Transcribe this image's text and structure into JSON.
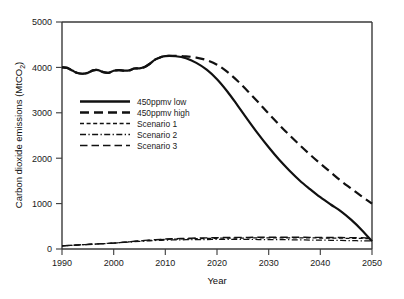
{
  "chart_data": {
    "type": "line",
    "title": "",
    "xlabel": "Year",
    "ylabel": "Carbon dioxide emissions (MtCO2)",
    "ylabel_display": "Carbon dioxide emissions (MtCO",
    "ylabel_sub": "2",
    "ylabel_tail": ")",
    "xlim": [
      1990,
      2050
    ],
    "ylim": [
      0,
      5000
    ],
    "xticks": [
      1990,
      2000,
      2010,
      2020,
      2030,
      2040,
      2050
    ],
    "xticklabels": [
      "1990",
      "2000",
      "2010",
      "2020",
      "2030",
      "2040",
      "2050"
    ],
    "yticks": [
      0,
      1000,
      2000,
      3000,
      4000,
      5000
    ],
    "yticklabels": [
      "0",
      "1000",
      "2000",
      "3000",
      "4000",
      "5000"
    ],
    "grid": false,
    "legend_position": "upper-left-inside",
    "line_color": "#111111",
    "x": [
      1990,
      1991,
      1992,
      1993,
      1994,
      1995,
      1996,
      1997,
      1998,
      1999,
      2000,
      2001,
      2002,
      2003,
      2004,
      2005,
      2006,
      2007,
      2008,
      2009,
      2010,
      2012,
      2014,
      2016,
      2018,
      2020,
      2022,
      2024,
      2026,
      2028,
      2030,
      2032,
      2034,
      2036,
      2038,
      2040,
      2042,
      2044,
      2046,
      2048,
      2050
    ],
    "series": [
      {
        "name": "450ppmv low",
        "style": "solid",
        "values": [
          4000,
          3990,
          3930,
          3875,
          3860,
          3880,
          3935,
          3940,
          3895,
          3880,
          3925,
          3940,
          3930,
          3935,
          3975,
          3980,
          4010,
          4080,
          4170,
          4220,
          4250,
          4245,
          4200,
          4100,
          3950,
          3740,
          3470,
          3160,
          2840,
          2530,
          2240,
          1970,
          1730,
          1510,
          1320,
          1140,
          980,
          830,
          640,
          420,
          170
        ]
      },
      {
        "name": "450ppmv high",
        "style": "long-dash",
        "values": [
          4000,
          3990,
          3930,
          3875,
          3860,
          3880,
          3935,
          3940,
          3895,
          3880,
          3925,
          3940,
          3930,
          3935,
          3975,
          3980,
          4010,
          4080,
          4170,
          4220,
          4250,
          4255,
          4245,
          4215,
          4160,
          4060,
          3900,
          3700,
          3470,
          3230,
          2980,
          2740,
          2510,
          2290,
          2080,
          1880,
          1690,
          1500,
          1330,
          1160,
          1000
        ]
      },
      {
        "name": "Scenario 1",
        "style": "short-dash",
        "values": [
          70,
          76,
          82,
          88,
          94,
          100,
          106,
          112,
          118,
          124,
          130,
          139,
          148,
          157,
          166,
          175,
          184,
          192,
          200,
          206,
          211,
          218,
          224,
          229,
          233,
          236,
          239,
          241,
          243,
          244,
          245,
          245,
          245,
          244,
          243,
          242,
          240,
          238,
          235,
          232,
          228
        ]
      },
      {
        "name": "Scenario 2",
        "style": "dash-dot",
        "values": [
          70,
          76,
          82,
          88,
          94,
          100,
          106,
          112,
          118,
          124,
          130,
          138,
          146,
          154,
          161,
          168,
          175,
          181,
          187,
          191,
          195,
          200,
          204,
          207,
          209,
          210,
          211,
          211,
          210,
          209,
          208,
          206,
          204,
          201,
          198,
          195,
          192,
          188,
          184,
          180,
          176
        ]
      },
      {
        "name": "Scenario 3",
        "style": "medium-dash",
        "values": [
          70,
          76,
          82,
          88,
          94,
          100,
          106,
          112,
          118,
          124,
          130,
          140,
          150,
          160,
          170,
          180,
          190,
          198,
          206,
          213,
          219,
          228,
          235,
          241,
          246,
          250,
          253,
          255,
          257,
          258,
          259,
          259,
          259,
          258,
          257,
          256,
          254,
          252,
          250,
          247,
          244
        ]
      }
    ],
    "legend": [
      {
        "label": "450ppmv low",
        "style": "solid"
      },
      {
        "label": "450ppmv high",
        "style": "long-dash"
      },
      {
        "label": "Scenario 1",
        "style": "short-dash"
      },
      {
        "label": "Scenario 2",
        "style": "dash-dot"
      },
      {
        "label": "Scenario 3",
        "style": "medium-dash"
      }
    ]
  }
}
